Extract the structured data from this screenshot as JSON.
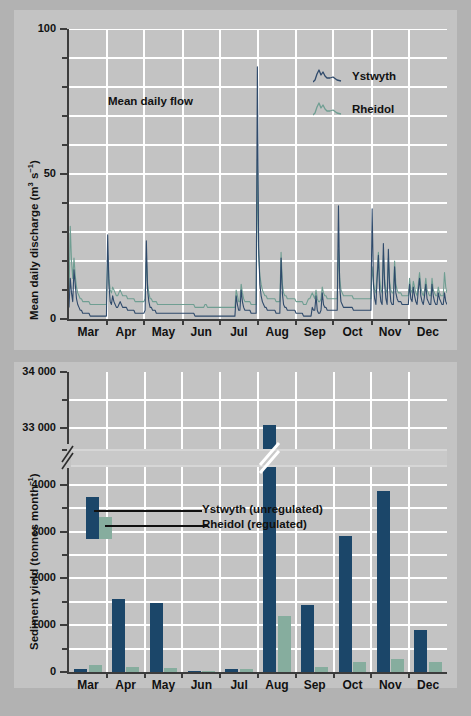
{
  "figure": {
    "background_color": "#b2b2b2",
    "panel_color": "#c3c3c3",
    "series_colors": {
      "ystwyth": "#1b4669",
      "rheidol": "#86ad9e"
    }
  },
  "top_chart": {
    "annotation": "Mean daily flow",
    "ylabel_main": "Mean daily discharge (m",
    "ylabel_sup1": "3",
    "ylabel_mid": " s",
    "ylabel_sup2": "−1",
    "ylabel_end": ")",
    "y_ticks_major": [
      "0",
      "50",
      "100"
    ],
    "x_ticks": [
      "Mar",
      "Apr",
      "May",
      "Jun",
      "Jul",
      "Aug",
      "Sep",
      "Oct",
      "Nov",
      "Dec"
    ],
    "legend": [
      {
        "label": "Ystwyth",
        "color": "#2f4a6b"
      },
      {
        "label": "Rheidol",
        "color": "#6f9e92"
      }
    ]
  },
  "bottom_chart": {
    "ylabel_main": "Sediment yield (tonnes month",
    "ylabel_sup": "−1",
    "ylabel_end": ")",
    "y_ticks_major": [
      "0",
      "1000",
      "2000",
      "3000",
      "4000",
      "33 000",
      "34 000"
    ],
    "x_ticks": [
      "Mar",
      "Apr",
      "May",
      "Jun",
      "Jul",
      "Aug",
      "Sep",
      "Oct",
      "Nov",
      "Dec"
    ],
    "legend": [
      {
        "label": "Ystwyth (unregulated)",
        "color": "#1b4669"
      },
      {
        "label": "Rheidol (regulated)",
        "color": "#86ad9e"
      }
    ],
    "axis_break": true
  },
  "chart_data": [
    {
      "type": "line",
      "title": "Mean daily flow",
      "xlabel": "",
      "ylabel": "Mean daily discharge (m3 s-1)",
      "ylim": [
        0,
        100
      ],
      "yticks": [
        0,
        50,
        100
      ],
      "yticks_minor_step": 10,
      "grid": true,
      "legend_position": "upper-right",
      "categories": [
        "Mar",
        "Apr",
        "May",
        "Jun",
        "Jul",
        "Aug",
        "Sep",
        "Oct",
        "Nov",
        "Dec"
      ],
      "notes": "Daily hydrograph, 1 Mar - 31 Dec. Ystwyth peaks to ~87 in early Aug.",
      "series": [
        {
          "name": "Ystwyth",
          "color": "#2f4a6b",
          "peak_max": 87,
          "peak_month": "Aug",
          "values": [
            4,
            14,
            9,
            6,
            17,
            12,
            7,
            5,
            4,
            3,
            3,
            2,
            2,
            2,
            2,
            2,
            2,
            1,
            1,
            1,
            1,
            1,
            1,
            1,
            1,
            1,
            1,
            1,
            1,
            1,
            1,
            29,
            12,
            6,
            5,
            8,
            6,
            5,
            4,
            4,
            5,
            6,
            5,
            4,
            4,
            4,
            4,
            3,
            3,
            3,
            3,
            3,
            3,
            2,
            2,
            2,
            2,
            2,
            2,
            2,
            2,
            3,
            27,
            10,
            6,
            4,
            4,
            3,
            3,
            3,
            2,
            2,
            2,
            2,
            2,
            2,
            2,
            2,
            2,
            2,
            2,
            2,
            2,
            2,
            2,
            2,
            2,
            2,
            2,
            2,
            2,
            2,
            2,
            2,
            2,
            2,
            2,
            2,
            2,
            2,
            2,
            1,
            1,
            1,
            1,
            1,
            1,
            1,
            1,
            1,
            1,
            1,
            1,
            1,
            1,
            1,
            1,
            1,
            1,
            1,
            1,
            1,
            1,
            1,
            1,
            1,
            1,
            1,
            1,
            1,
            1,
            1,
            1,
            1,
            8,
            5,
            3,
            3,
            10,
            6,
            4,
            3,
            3,
            3,
            3,
            3,
            2,
            2,
            2,
            2,
            2,
            87,
            25,
            12,
            8,
            6,
            5,
            4,
            4,
            3,
            3,
            3,
            3,
            3,
            3,
            3,
            2,
            2,
            2,
            2,
            21,
            9,
            5,
            4,
            4,
            3,
            3,
            3,
            3,
            3,
            3,
            3,
            2,
            2,
            2,
            2,
            2,
            2,
            1,
            1,
            1,
            1,
            1,
            1,
            1,
            4,
            3,
            3,
            8,
            3,
            2,
            2,
            3,
            9,
            5,
            4,
            4,
            3,
            3,
            3,
            3,
            3,
            3,
            3,
            3,
            3,
            39,
            11,
            6,
            5,
            4,
            4,
            4,
            4,
            4,
            4,
            4,
            4,
            3,
            3,
            3,
            3,
            3,
            3,
            3,
            3,
            3,
            3,
            3,
            3,
            3,
            3,
            3,
            38,
            12,
            7,
            5,
            14,
            22,
            10,
            6,
            5,
            26,
            12,
            7,
            5,
            24,
            11,
            6,
            5,
            5,
            18,
            9,
            7,
            6,
            6,
            6,
            5,
            5,
            5,
            5,
            5,
            5,
            12,
            7,
            6,
            11,
            8,
            6,
            5,
            10,
            14,
            8,
            6,
            5,
            8,
            12,
            7,
            6,
            5,
            5,
            12,
            8,
            6,
            5,
            5,
            9,
            7,
            6,
            5,
            5,
            9,
            6,
            5
          ]
        },
        {
          "name": "Rheidol",
          "color": "#6f9e92",
          "peak_max": 32,
          "peak_month": "Mar",
          "values": [
            7,
            32,
            20,
            14,
            21,
            15,
            11,
            9,
            8,
            7,
            7,
            6,
            6,
            6,
            6,
            6,
            6,
            5,
            5,
            5,
            5,
            5,
            5,
            5,
            5,
            5,
            5,
            5,
            5,
            5,
            5,
            22,
            14,
            10,
            9,
            11,
            10,
            9,
            8,
            8,
            9,
            10,
            9,
            8,
            8,
            8,
            8,
            7,
            7,
            7,
            7,
            7,
            7,
            6,
            6,
            6,
            6,
            6,
            6,
            6,
            6,
            7,
            21,
            12,
            9,
            7,
            7,
            6,
            6,
            6,
            6,
            5,
            5,
            5,
            5,
            5,
            5,
            5,
            5,
            5,
            5,
            5,
            5,
            5,
            5,
            5,
            5,
            5,
            5,
            5,
            5,
            5,
            5,
            5,
            5,
            5,
            5,
            5,
            5,
            5,
            5,
            4,
            4,
            4,
            4,
            4,
            4,
            4,
            4,
            5,
            5,
            4,
            4,
            4,
            4,
            4,
            4,
            4,
            4,
            4,
            4,
            4,
            4,
            4,
            4,
            4,
            4,
            4,
            4,
            4,
            4,
            4,
            4,
            4,
            10,
            8,
            6,
            6,
            12,
            9,
            7,
            6,
            6,
            6,
            6,
            6,
            5,
            5,
            5,
            5,
            5,
            55,
            22,
            15,
            12,
            10,
            9,
            8,
            8,
            7,
            7,
            7,
            7,
            7,
            7,
            7,
            6,
            6,
            6,
            6,
            23,
            12,
            9,
            8,
            8,
            7,
            7,
            7,
            7,
            7,
            7,
            7,
            6,
            6,
            6,
            6,
            6,
            6,
            5,
            5,
            5,
            6,
            7,
            7,
            8,
            9,
            8,
            7,
            10,
            7,
            6,
            6,
            7,
            11,
            9,
            8,
            8,
            7,
            7,
            7,
            7,
            7,
            7,
            7,
            7,
            7,
            24,
            14,
            10,
            9,
            8,
            8,
            8,
            8,
            8,
            8,
            8,
            8,
            7,
            7,
            7,
            7,
            7,
            7,
            7,
            7,
            7,
            7,
            7,
            7,
            7,
            7,
            7,
            18,
            13,
            10,
            9,
            16,
            23,
            14,
            10,
            9,
            22,
            14,
            10,
            9,
            21,
            13,
            10,
            9,
            9,
            20,
            12,
            10,
            9,
            9,
            9,
            8,
            8,
            8,
            8,
            8,
            8,
            14,
            10,
            9,
            13,
            11,
            9,
            8,
            12,
            16,
            11,
            9,
            8,
            10,
            14,
            10,
            9,
            8,
            8,
            14,
            10,
            9,
            8,
            8,
            11,
            9,
            8,
            8,
            8,
            16,
            11,
            9
          ]
        }
      ]
    },
    {
      "type": "bar",
      "title": "",
      "xlabel": "",
      "ylabel": "Sediment yield (tonnes month-1)",
      "categories": [
        "Mar",
        "Apr",
        "May",
        "Jun",
        "Jul",
        "Aug",
        "Sep",
        "Oct",
        "Nov",
        "Dec"
      ],
      "ylim_lower": [
        0,
        4400
      ],
      "ylim_upper": [
        32600,
        34000
      ],
      "yticks": [
        0,
        1000,
        2000,
        3000,
        4000,
        33000,
        34000
      ],
      "yticks_minor_step": 500,
      "axis_break_between": [
        4400,
        32600
      ],
      "grid": true,
      "legend_position": "inside-left",
      "series": [
        {
          "name": "Ystwyth (unregulated)",
          "color": "#1b4669",
          "values": [
            70,
            1560,
            1470,
            20,
            70,
            33050,
            1430,
            2900,
            3870,
            900
          ]
        },
        {
          "name": "Rheidol (regulated)",
          "color": "#86ad9e",
          "values": [
            160,
            110,
            80,
            15,
            60,
            1190,
            100,
            210,
            280,
            210
          ]
        }
      ]
    }
  ]
}
